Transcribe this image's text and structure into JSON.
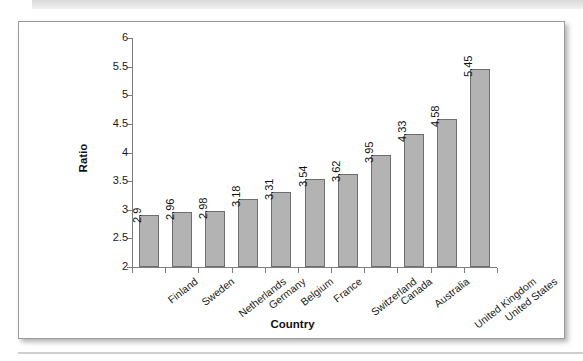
{
  "figure": {
    "background_color": "#ffffff",
    "border_color": "#9a9a9a"
  },
  "chart_data": {
    "type": "bar",
    "title": "",
    "subtitle": "",
    "xlabel": "Country",
    "ylabel": "Ratio",
    "categories": [
      "Finland",
      "Sweden",
      "Netherlands",
      "Germany",
      "Belgium",
      "France",
      "Switzerland",
      "Canada",
      "Australia",
      "United Kingdom",
      "United States"
    ],
    "values": [
      2.9,
      2.96,
      2.98,
      3.18,
      3.31,
      3.54,
      3.62,
      3.95,
      4.33,
      4.58,
      5.45
    ],
    "value_labels": [
      "2.9",
      "2.96",
      "2.98",
      "3.18",
      "3.31",
      "3.54",
      "3.62",
      "3.95",
      "4.33",
      "4.58",
      "5.45"
    ],
    "ylim": [
      2,
      6
    ],
    "ytick_labels": [
      "6",
      "5.5",
      "5",
      "4.5",
      "4",
      "3.5",
      "3",
      "2.5",
      "2"
    ],
    "ytick_values": [
      6,
      5.5,
      5,
      4.5,
      4,
      3.5,
      3,
      2.5,
      2
    ],
    "grid": false,
    "legend": null,
    "bar_color": "#b3b3b3",
    "bar_border_color": "#6e6e6e",
    "axis_color": "#7d7d7d",
    "value_label_rotation": -90,
    "category_label_rotation": -38
  }
}
